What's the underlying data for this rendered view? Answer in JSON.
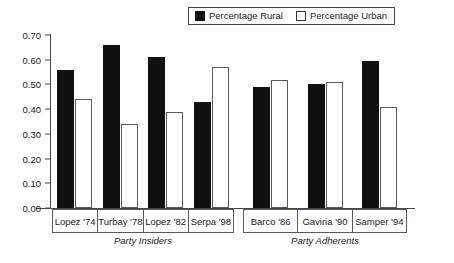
{
  "legend": {
    "entries": [
      {
        "label": "Percentage Rural",
        "swatch": "filled-square-icon",
        "color": "#111111"
      },
      {
        "label": "Percentage  Urban",
        "swatch": "open-square-icon",
        "color": "#ffffff"
      }
    ]
  },
  "chart_data": {
    "type": "bar",
    "title": "",
    "xlabel": "",
    "ylabel": "",
    "ylim": [
      0.0,
      0.7
    ],
    "ytick_labels": [
      "0.70",
      "0.60",
      "0.50",
      "0.40",
      "0.30",
      "0.20",
      "0.10",
      "0.00"
    ],
    "ytick_values": [
      0.7,
      0.6,
      0.5,
      0.4,
      0.3,
      0.2,
      0.1,
      0.0
    ],
    "grid": false,
    "legend_position": "top-center",
    "categories": [
      "Lopez '74",
      "Turbay '78",
      "Lopez '82",
      "Serpa '98",
      "Barco '86",
      "Gaviria '90",
      "Samper '94"
    ],
    "series": [
      {
        "name": "Percentage Rural",
        "values": [
          0.56,
          0.66,
          0.61,
          0.43,
          0.49,
          0.5,
          0.595
        ]
      },
      {
        "name": "Percentage  Urban",
        "values": [
          0.44,
          0.34,
          0.39,
          0.57,
          0.52,
          0.51,
          0.41
        ]
      }
    ],
    "groups": [
      {
        "title": "Party Insiders",
        "categories": [
          "Lopez '74",
          "Turbay '78",
          "Lopez '82",
          "Serpa '98"
        ]
      },
      {
        "title": "Party Adherents",
        "categories": [
          "Barco '86",
          "Gaviria '90",
          "Samper '94"
        ]
      }
    ]
  }
}
